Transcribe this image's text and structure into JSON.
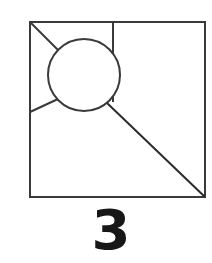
{
  "figure": {
    "name": "geometric-figure-square-circle",
    "background_color": "#ffffff",
    "stroke_color": "#3a3a3a",
    "stroke_color_dark": "#2b2b2b",
    "stroke_width": 2,
    "square": {
      "name": "outer-square",
      "x": 30,
      "y": 22,
      "width": 175,
      "height": 175
    },
    "circle": {
      "name": "inner-circle",
      "cx": 84,
      "cy": 75,
      "r": 36
    },
    "lines": [
      {
        "name": "top-left-corner-to-circle",
        "x1": 30,
        "y1": 22,
        "x2": 61,
        "y2": 53
      },
      {
        "name": "top-edge-vertical-to-circle",
        "x1": 113,
        "y1": 22,
        "x2": 113,
        "y2": 102
      },
      {
        "name": "left-edge-to-circle",
        "x1": 30,
        "y1": 112,
        "x2": 58,
        "y2": 99
      },
      {
        "name": "circle-to-bottom-right-corner",
        "x1": 107,
        "y1": 103,
        "x2": 205,
        "y2": 197
      }
    ]
  },
  "caption": {
    "number": "3"
  },
  "chart_data": {
    "type": "diagram",
    "title": "",
    "figure_label": "3",
    "shapes": [
      {
        "shape": "square",
        "x": 30,
        "y": 22,
        "width": 175,
        "height": 175
      },
      {
        "shape": "circle",
        "cx": 84,
        "cy": 75,
        "r": 36
      },
      {
        "shape": "line",
        "from": [
          30,
          22
        ],
        "to": [
          61,
          53
        ]
      },
      {
        "shape": "line",
        "from": [
          113,
          22
        ],
        "to": [
          113,
          102
        ]
      },
      {
        "shape": "line",
        "from": [
          30,
          112
        ],
        "to": [
          58,
          99
        ]
      },
      {
        "shape": "line",
        "from": [
          107,
          103
        ],
        "to": [
          205,
          197
        ]
      }
    ]
  }
}
